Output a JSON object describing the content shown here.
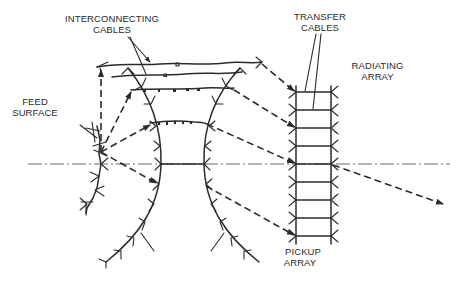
{
  "diagram": {
    "labels": {
      "interconnecting_cables_l1": "INTERCONNECTING",
      "interconnecting_cables_l2": "CABLES",
      "transfer_cables_l1": "TRANSFER",
      "transfer_cables_l2": "CABLES",
      "radiating_array_l1": "RADIATING",
      "radiating_array_l2": "ARRAY",
      "feed_surface_l1": "FEED",
      "feed_surface_l2": "SURFACE",
      "pickup_array_l1": "PICKUP",
      "pickup_array_l2": "ARRAY"
    },
    "components": [
      "feed-surface",
      "curved-reflector-surfaces",
      "interconnecting-cables",
      "pickup-array",
      "transfer-cables",
      "radiating-array",
      "optical-axis",
      "ray-paths"
    ],
    "colors": {
      "ink": "#2b2b2b",
      "background": "#ffffff"
    }
  }
}
